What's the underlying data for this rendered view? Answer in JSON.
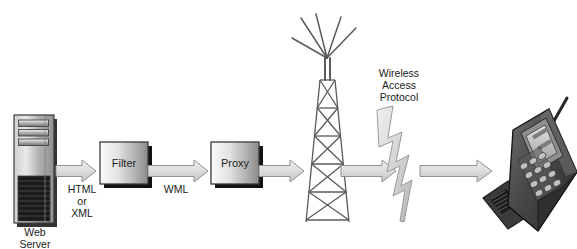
{
  "diagram": {
    "background_color": "#ffffff",
    "nodes": {
      "web_server": {
        "label_line1": "Web",
        "label_line2": "Server",
        "icon": "server-tower-icon"
      },
      "filter": {
        "label": "Filter",
        "icon": "process-box-icon"
      },
      "proxy": {
        "label": "Proxy",
        "icon": "process-box-icon"
      },
      "tower": {
        "icon": "radio-tower-icon"
      },
      "phone": {
        "icon": "mobile-flip-phone-icon"
      }
    },
    "edges": {
      "server_to_filter": {
        "label_line1": "HTML",
        "label_line2": "or",
        "label_line3": "XML",
        "icon": "block-arrow-right-icon"
      },
      "filter_to_proxy": {
        "label": "WML",
        "icon": "block-arrow-right-icon"
      },
      "proxy_to_tower": {
        "label": "",
        "icon": "block-arrow-right-icon"
      },
      "tower_to_air": {
        "label": "",
        "icon": "block-arrow-right-icon"
      },
      "air_to_phone": {
        "label": "",
        "icon": "block-arrow-right-icon"
      }
    },
    "annotations": {
      "wap": {
        "line1": "Wireless",
        "line2": "Access",
        "line3": "Protocol",
        "icon": "lightning-bolt-icon"
      }
    },
    "colors": {
      "outline": "#3a3a3a",
      "arrow_fill": "#d8d8d8",
      "arrow_stroke": "#8e8e8e",
      "box_light": "#f2f2f2",
      "box_dark": "#8d8d8d",
      "shadow": "#111111",
      "text": "#1a1a1a",
      "server_body": "#b9b9b9",
      "server_grille": "#1c1c1c",
      "phone_body": "#4a4a4a",
      "phone_screen": "#c9c9c9"
    }
  }
}
